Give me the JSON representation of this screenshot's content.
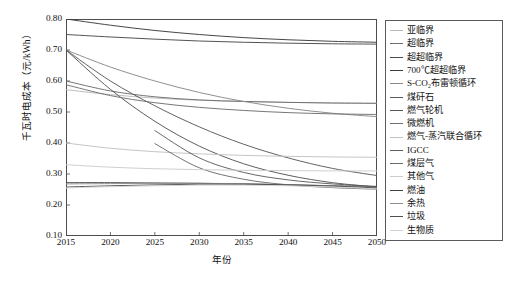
{
  "chart_data": {
    "type": "line",
    "title": "",
    "xlabel": "年份",
    "ylabel": "千瓦时电成本（元/kWh）",
    "xlim": [
      2015,
      2050
    ],
    "ylim": [
      0.1,
      0.8
    ],
    "xticks": [
      2015,
      2020,
      2025,
      2030,
      2035,
      2040,
      2045,
      2050
    ],
    "yticks": [
      "0.10",
      "0.20",
      "0.30",
      "0.40",
      "0.50",
      "0.60",
      "0.70",
      "0.80"
    ],
    "grid": false,
    "legend_position": "right-outside",
    "x": [
      2015,
      2020,
      2025,
      2030,
      2035,
      2040,
      2045,
      2050
    ],
    "series": [
      {
        "name": "亚临界",
        "color": "#b9b9b9",
        "values": [
          0.572,
          0.556,
          0.545,
          0.538,
          0.534,
          0.531,
          0.529,
          0.528
        ]
      },
      {
        "name": "超临界",
        "color": "#6f6f6f",
        "values": [
          0.6,
          0.568,
          0.549,
          0.539,
          0.534,
          0.531,
          0.529,
          0.528
        ]
      },
      {
        "name": "超超临界",
        "color": "#4a4a4a",
        "values": [
          0.75,
          0.742,
          0.735,
          0.729,
          0.725,
          0.722,
          0.72,
          0.719
        ]
      },
      {
        "name": "700℃超超临界",
        "color": "#3c3c3c",
        "values": [
          0.8,
          0.78,
          0.763,
          0.75,
          0.74,
          0.733,
          0.728,
          0.725
        ]
      },
      {
        "name": "S-CO₂布雷顿循环",
        "color": "#8a8a8a",
        "values": [
          0.7,
          0.645,
          0.6,
          0.563,
          0.534,
          0.512,
          0.496,
          0.485
        ]
      },
      {
        "name": "煤矸石",
        "color": "#5a5a5a",
        "values": [
          0.7,
          0.6,
          0.52,
          0.452,
          0.396,
          0.352,
          0.318,
          0.295
        ]
      },
      {
        "name": "燃气轮机",
        "color": "#555555",
        "values": [
          0.7,
          0.573,
          0.47,
          0.39,
          0.333,
          0.296,
          0.272,
          0.258
        ]
      },
      {
        "name": "微燃机",
        "color": "#707070",
        "values": [
          0.588,
          0.553,
          0.53,
          0.515,
          0.505,
          0.498,
          0.494,
          0.492
        ]
      },
      {
        "name": "燃气-蒸汽联合循环",
        "color": "#c2c2c2",
        "values": [
          0.4,
          0.383,
          0.372,
          0.365,
          0.36,
          0.357,
          0.355,
          0.354
        ]
      },
      {
        "name": "IGCC",
        "color": "#5e5e5e",
        "values": [
          null,
          null,
          0.44,
          0.352,
          0.305,
          0.281,
          0.268,
          0.26
        ]
      },
      {
        "name": "煤层气",
        "color": "#6b6b6b",
        "values": [
          null,
          null,
          0.398,
          0.32,
          0.283,
          0.265,
          0.256,
          0.251
        ]
      },
      {
        "name": "其他气",
        "color": "#cccccc",
        "values": [
          0.33,
          0.322,
          0.317,
          0.314,
          0.312,
          0.311,
          0.31,
          0.31
        ]
      },
      {
        "name": "燃油",
        "color": "#3f3f3f",
        "values": [
          0.272,
          0.272,
          0.271,
          0.27,
          0.268,
          0.265,
          0.262,
          0.259
        ]
      },
      {
        "name": "余热",
        "color": "#8f8f8f",
        "values": [
          0.268,
          0.269,
          0.27,
          0.27,
          0.269,
          0.266,
          0.262,
          0.257
        ]
      },
      {
        "name": "垃圾",
        "color": "#4f4f4f",
        "values": [
          0.258,
          0.262,
          0.265,
          0.267,
          0.267,
          0.265,
          0.261,
          0.255
        ]
      },
      {
        "name": "生物质",
        "color": "#d2d2d2",
        "values": [
          0.255,
          0.259,
          0.262,
          0.264,
          0.264,
          0.262,
          0.258,
          0.252
        ]
      }
    ]
  },
  "legend": {
    "items": [
      {
        "label": "亚临界"
      },
      {
        "label": "超临界"
      },
      {
        "label": "超超临界"
      },
      {
        "label": "700℃超超临界"
      },
      {
        "label": "S-CO₂布雷顿循环"
      },
      {
        "label": "煤矸石"
      },
      {
        "label": "燃气轮机"
      },
      {
        "label": "微燃机"
      },
      {
        "label": "燃气-蒸汽联合循环"
      },
      {
        "label": "IGCC"
      },
      {
        "label": "煤层气"
      },
      {
        "label": "其他气"
      },
      {
        "label": "燃油"
      },
      {
        "label": "余热"
      },
      {
        "label": "垃圾"
      },
      {
        "label": "生物质"
      }
    ]
  }
}
